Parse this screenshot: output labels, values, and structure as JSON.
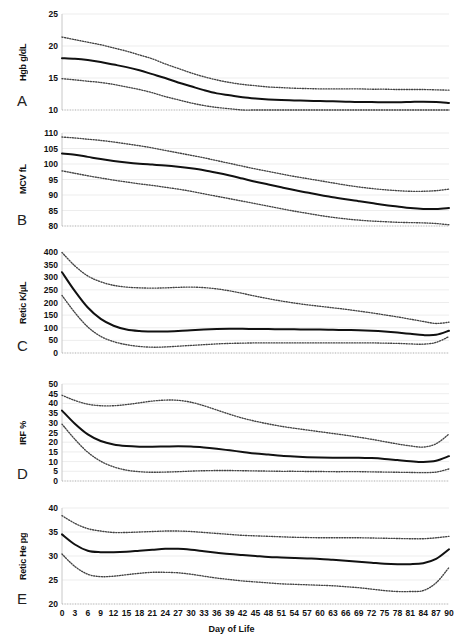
{
  "figure": {
    "title": "",
    "panel_letters": [
      "A",
      "B",
      "C",
      "D",
      "E"
    ],
    "xaxis_title": "Day of Life",
    "xticks": [
      0,
      3,
      6,
      9,
      12,
      15,
      18,
      21,
      24,
      27,
      30,
      33,
      36,
      39,
      42,
      45,
      48,
      51,
      54,
      57,
      60,
      63,
      66,
      69,
      72,
      75,
      78,
      81,
      84,
      87,
      90
    ],
    "line_colors": {
      "median": "#111111",
      "percentile": "#444444",
      "grid": "#e8e8e8",
      "axis": "#c8c8c8"
    }
  },
  "chart_data": [
    {
      "type": "line",
      "panel": "A",
      "title": "",
      "ylabel": "Hgb g/dL",
      "xlabel": "Day of Life",
      "ylim": [
        10,
        25
      ],
      "yticks": [
        10,
        15,
        20,
        25
      ],
      "xlim": [
        0,
        90
      ],
      "grid": true,
      "legend": "none",
      "x": [
        0,
        3,
        6,
        9,
        12,
        15,
        18,
        21,
        24,
        27,
        30,
        33,
        36,
        39,
        42,
        45,
        48,
        51,
        54,
        57,
        60,
        63,
        66,
        69,
        72,
        75,
        78,
        81,
        84,
        87,
        90
      ],
      "series": [
        {
          "name": "upper percentile",
          "style": "dotted",
          "values": [
            21.4,
            21.0,
            20.6,
            20.2,
            19.7,
            19.2,
            18.6,
            18.0,
            17.2,
            16.5,
            15.8,
            15.2,
            14.7,
            14.3,
            14.0,
            13.8,
            13.6,
            13.5,
            13.4,
            13.35,
            13.3,
            13.3,
            13.3,
            13.3,
            13.25,
            13.25,
            13.2,
            13.2,
            13.2,
            13.15,
            13.1
          ]
        },
        {
          "name": "median",
          "style": "solid",
          "values": [
            18.1,
            18.0,
            17.8,
            17.5,
            17.1,
            16.7,
            16.2,
            15.6,
            15.0,
            14.3,
            13.7,
            13.1,
            12.6,
            12.3,
            12.0,
            11.8,
            11.65,
            11.55,
            11.5,
            11.45,
            11.4,
            11.35,
            11.3,
            11.25,
            11.25,
            11.2,
            11.2,
            11.25,
            11.3,
            11.25,
            11.1
          ]
        },
        {
          "name": "lower percentile",
          "style": "dotted",
          "values": [
            14.9,
            14.7,
            14.5,
            14.3,
            14.0,
            13.6,
            13.2,
            12.7,
            12.1,
            11.6,
            11.1,
            10.7,
            10.4,
            10.2,
            10.0,
            9.9,
            9.85,
            9.8,
            9.8,
            9.8,
            9.8,
            9.8,
            9.8,
            9.85,
            9.9,
            9.9,
            9.9,
            9.9,
            9.9,
            9.8,
            9.5
          ]
        }
      ]
    },
    {
      "type": "line",
      "panel": "B",
      "title": "",
      "ylabel": "MCV fL",
      "xlabel": "Day of Life",
      "ylim": [
        80,
        110
      ],
      "yticks": [
        80,
        85,
        90,
        95,
        100,
        105,
        110
      ],
      "xlim": [
        0,
        90
      ],
      "grid": true,
      "legend": "none",
      "x": [
        0,
        3,
        6,
        9,
        12,
        15,
        18,
        21,
        24,
        27,
        30,
        33,
        36,
        39,
        42,
        45,
        48,
        51,
        54,
        57,
        60,
        63,
        66,
        69,
        72,
        75,
        78,
        81,
        84,
        87,
        90
      ],
      "series": [
        {
          "name": "upper percentile",
          "style": "dotted",
          "values": [
            108.7,
            108.4,
            108.0,
            107.6,
            107.1,
            106.5,
            105.9,
            105.2,
            104.4,
            103.6,
            102.8,
            102.0,
            101.1,
            100.2,
            99.3,
            98.4,
            97.6,
            96.8,
            96.0,
            95.3,
            94.6,
            93.9,
            93.2,
            92.6,
            92.1,
            91.7,
            91.4,
            91.2,
            91.2,
            91.4,
            91.9
          ]
        },
        {
          "name": "median",
          "style": "solid",
          "values": [
            103.4,
            103.0,
            102.3,
            101.6,
            101.0,
            100.5,
            100.1,
            99.8,
            99.5,
            99.1,
            98.6,
            98.0,
            97.2,
            96.3,
            95.3,
            94.3,
            93.4,
            92.5,
            91.6,
            90.8,
            90.0,
            89.3,
            88.6,
            88.0,
            87.4,
            86.8,
            86.3,
            85.8,
            85.5,
            85.5,
            85.8
          ]
        },
        {
          "name": "lower percentile",
          "style": "dotted",
          "values": [
            97.8,
            97.0,
            96.2,
            95.5,
            94.8,
            94.2,
            93.6,
            93.1,
            92.5,
            91.9,
            91.2,
            90.4,
            89.6,
            88.8,
            88.0,
            87.2,
            86.4,
            85.6,
            84.8,
            84.1,
            83.4,
            82.8,
            82.3,
            81.9,
            81.6,
            81.4,
            81.2,
            81.1,
            81.0,
            80.8,
            80.4
          ]
        }
      ]
    },
    {
      "type": "line",
      "panel": "C",
      "title": "",
      "ylabel": "Retic K/µL",
      "xlabel": "Day of Life",
      "ylim": [
        0,
        400
      ],
      "yticks": [
        0,
        50,
        100,
        150,
        200,
        250,
        300,
        350,
        400
      ],
      "xlim": [
        0,
        90
      ],
      "grid": true,
      "legend": "none",
      "x": [
        0,
        3,
        6,
        9,
        12,
        15,
        18,
        21,
        24,
        27,
        30,
        33,
        36,
        39,
        42,
        45,
        48,
        51,
        54,
        57,
        60,
        63,
        66,
        69,
        72,
        75,
        78,
        81,
        84,
        87,
        90
      ],
      "series": [
        {
          "name": "upper percentile",
          "style": "dotted",
          "values": [
            398,
            345,
            305,
            282,
            268,
            261,
            258,
            257,
            258,
            260,
            261,
            259,
            254,
            246,
            236,
            225,
            215,
            206,
            198,
            191,
            185,
            179,
            173,
            166,
            159,
            151,
            143,
            134,
            125,
            117,
            122
          ]
        },
        {
          "name": "median",
          "style": "solid",
          "values": [
            320,
            245,
            180,
            135,
            108,
            93,
            87,
            85,
            85,
            87,
            90,
            93,
            95,
            96,
            96,
            95,
            95,
            94,
            94,
            93,
            93,
            92,
            91,
            90,
            88,
            85,
            81,
            76,
            71,
            72,
            88
          ]
        },
        {
          "name": "lower percentile",
          "style": "dotted",
          "values": [
            228,
            160,
            103,
            66,
            45,
            33,
            26,
            23,
            24,
            27,
            30,
            33,
            36,
            38,
            39,
            40,
            40,
            40,
            40,
            40,
            40,
            40,
            40,
            40,
            40,
            39,
            38,
            36,
            35,
            42,
            65
          ]
        }
      ]
    },
    {
      "type": "line",
      "panel": "D",
      "title": "",
      "ylabel": "IRF %",
      "xlabel": "Day of Life",
      "ylim": [
        0,
        50
      ],
      "yticks": [
        0,
        5,
        10,
        15,
        20,
        25,
        30,
        35,
        40,
        45,
        50
      ],
      "xlim": [
        0,
        90
      ],
      "grid": true,
      "legend": "none",
      "x": [
        0,
        3,
        6,
        9,
        12,
        15,
        18,
        21,
        24,
        27,
        30,
        33,
        36,
        39,
        42,
        45,
        48,
        51,
        54,
        57,
        60,
        63,
        66,
        69,
        72,
        75,
        78,
        81,
        84,
        87,
        90
      ],
      "series": [
        {
          "name": "upper percentile",
          "style": "dotted",
          "values": [
            44.2,
            41.5,
            39.6,
            38.8,
            38.8,
            39.4,
            40.3,
            41.2,
            41.7,
            41.6,
            40.6,
            38.8,
            36.6,
            34.4,
            32.4,
            30.8,
            29.4,
            28.2,
            27.2,
            26.3,
            25.4,
            24.5,
            23.6,
            22.6,
            21.5,
            20.3,
            19.1,
            18.1,
            17.5,
            19.2,
            24.2
          ]
        },
        {
          "name": "median",
          "style": "solid",
          "values": [
            36.3,
            29.5,
            24.0,
            20.6,
            18.8,
            18.0,
            17.7,
            17.7,
            17.8,
            17.9,
            17.8,
            17.3,
            16.6,
            15.8,
            15.0,
            14.2,
            13.6,
            13.0,
            12.6,
            12.3,
            12.1,
            12.0,
            12.0,
            12.0,
            11.8,
            11.4,
            10.8,
            10.2,
            9.8,
            10.4,
            12.8
          ]
        },
        {
          "name": "lower percentile",
          "style": "dotted",
          "values": [
            29.3,
            21.5,
            14.8,
            10.2,
            7.3,
            5.6,
            4.8,
            4.5,
            4.6,
            4.8,
            5.1,
            5.3,
            5.4,
            5.4,
            5.3,
            5.2,
            5.1,
            5.0,
            5.0,
            4.9,
            4.9,
            4.8,
            4.8,
            4.8,
            4.7,
            4.6,
            4.5,
            4.4,
            4.3,
            4.6,
            6.2
          ]
        }
      ]
    },
    {
      "type": "line",
      "panel": "E",
      "title": "",
      "ylabel": "Retic He pg",
      "xlabel": "Day of Life",
      "ylim": [
        20,
        40
      ],
      "yticks": [
        20,
        25,
        30,
        35,
        40
      ],
      "xlim": [
        0,
        90
      ],
      "grid": true,
      "legend": "none",
      "x": [
        0,
        3,
        6,
        9,
        12,
        15,
        18,
        21,
        24,
        27,
        30,
        33,
        36,
        39,
        42,
        45,
        48,
        51,
        54,
        57,
        60,
        63,
        66,
        69,
        72,
        75,
        78,
        81,
        84,
        87,
        90
      ],
      "series": [
        {
          "name": "upper percentile",
          "style": "dotted",
          "values": [
            38.4,
            36.8,
            35.7,
            35.2,
            34.9,
            34.9,
            35.0,
            35.1,
            35.2,
            35.2,
            35.1,
            34.9,
            34.7,
            34.5,
            34.3,
            34.2,
            34.1,
            34.0,
            33.9,
            33.85,
            33.8,
            33.8,
            33.8,
            33.8,
            33.75,
            33.7,
            33.65,
            33.6,
            33.6,
            33.8,
            34.1
          ]
        },
        {
          "name": "median",
          "style": "solid",
          "values": [
            34.5,
            32.4,
            31.1,
            30.8,
            30.8,
            30.9,
            31.1,
            31.3,
            31.5,
            31.5,
            31.3,
            31.0,
            30.7,
            30.4,
            30.2,
            30.0,
            29.8,
            29.7,
            29.6,
            29.5,
            29.4,
            29.2,
            29.0,
            28.8,
            28.6,
            28.4,
            28.3,
            28.3,
            28.5,
            29.4,
            31.4
          ]
        },
        {
          "name": "lower percentile",
          "style": "dotted",
          "values": [
            30.4,
            27.8,
            26.2,
            25.7,
            25.8,
            26.1,
            26.4,
            26.6,
            26.6,
            26.5,
            26.2,
            25.8,
            25.4,
            25.1,
            24.8,
            24.6,
            24.4,
            24.2,
            24.1,
            24.0,
            23.9,
            23.8,
            23.6,
            23.4,
            23.1,
            22.8,
            22.6,
            22.6,
            22.8,
            24.4,
            27.6
          ]
        }
      ]
    }
  ]
}
